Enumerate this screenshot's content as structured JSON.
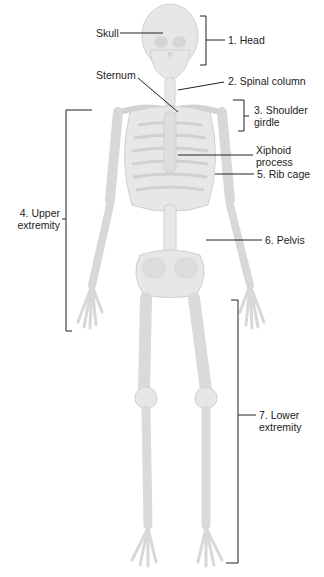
{
  "figure": {
    "bone_color": "#e6e6e6",
    "bone_shade": "#d2d2d2",
    "leader_color": "#222222"
  },
  "labels": {
    "skull": "Skull",
    "head": "1. Head",
    "sternum": "Sternum",
    "spinal_column": "2. Spinal column",
    "shoulder_girdle_1": "3. Shoulder",
    "shoulder_girdle_2": "girdle",
    "xiphoid_1": "Xiphoid",
    "xiphoid_2": "process",
    "rib_cage": "5. Rib cage",
    "upper_extremity_1": "4. Upper",
    "upper_extremity_2": "extremity",
    "pelvis": "6. Pelvis",
    "lower_extremity_1": "7. Lower",
    "lower_extremity_2": "extremity"
  }
}
